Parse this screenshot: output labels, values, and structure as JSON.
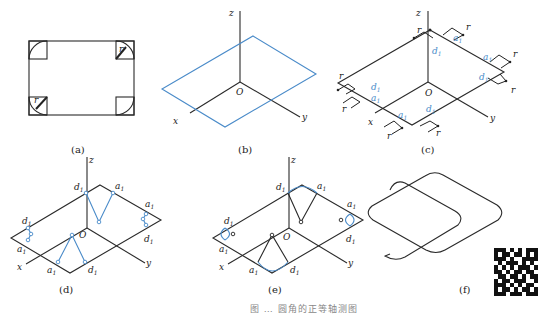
{
  "figure": {
    "caption": "图 … 圆角的正等轴测图",
    "panels": [
      {
        "id": "a",
        "label": "(a)",
        "description": "Rectangle plate with rounded corners (orthographic top view), radius r marked at two corners",
        "labels": [
          "r",
          "r"
        ]
      },
      {
        "id": "b",
        "label": "(b)",
        "description": "Isometric axes with blue rhombus (isometric rectangle)",
        "axis_labels": {
          "z": "z",
          "origin": "O",
          "x": "x",
          "y": "y"
        }
      },
      {
        "id": "c",
        "label": "(c)",
        "description": "Marking tangent points at distance r from each corner",
        "axis_labels": {
          "z": "z",
          "origin": "O",
          "x": "x",
          "y": "y"
        },
        "point_labels": [
          "d1",
          "a1",
          "a1",
          "d1",
          "d1",
          "a1",
          "a1",
          "d1"
        ],
        "dimension_label": "r"
      },
      {
        "id": "d",
        "label": "(d)",
        "description": "Drawing perpendiculars from tangent points to find arc centers",
        "axis_labels": {
          "z": "z",
          "origin": "O",
          "x": "x",
          "y": "y"
        },
        "point_labels": [
          "d1",
          "a1",
          "a1",
          "d1",
          "d1",
          "a1",
          "a1",
          "d1"
        ]
      },
      {
        "id": "e",
        "label": "(e)",
        "description": "Drawing arcs from centers between tangent points",
        "axis_labels": {
          "z": "z",
          "origin": "O",
          "x": "x",
          "y": "y"
        },
        "point_labels": [
          "d1",
          "a1",
          "a1",
          "d1",
          "d1",
          "a1",
          "a1",
          "d1"
        ]
      },
      {
        "id": "f",
        "label": "(f)",
        "description": "Final isometric view of rounded rectangle"
      }
    ],
    "labels": {
      "a": "(a)",
      "b": "(b)",
      "c": "(c)",
      "d": "(d)",
      "e": "(e)",
      "f": "(f)",
      "z": "z",
      "x": "x",
      "y": "y",
      "O": "O",
      "r": "r",
      "d1": "d",
      "a1": "a",
      "sub1": "1"
    },
    "colors": {
      "line": "#2a2a2a",
      "accent": "#4a8bc9"
    }
  }
}
